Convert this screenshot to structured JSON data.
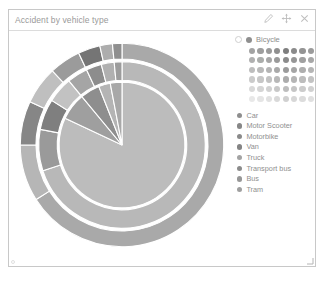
{
  "panel": {
    "title": "Accident by vehicle type",
    "tools": [
      {
        "name": "edit-icon",
        "label": "Edit"
      },
      {
        "name": "move-icon",
        "label": "Move"
      },
      {
        "name": "close-icon",
        "label": "Close"
      }
    ]
  },
  "selected": {
    "label": "Bicycle",
    "dot_color": "#8f8f8f",
    "ring_color": "#ffffff"
  },
  "palette": {
    "columns": 8,
    "rows": 6,
    "colors": [
      "#a3a3a3",
      "#9e9e9e",
      "#9a9a9a",
      "#8f8f8f",
      "#7e7e7e",
      "#8a8a8a",
      "#949494",
      "#9b9b9b",
      "#b0b0b0",
      "#abadab",
      "#a6a6a6",
      "#9a9a9a",
      "#8b8b8b",
      "#969696",
      "#a0a0a0",
      "#a7a7a7",
      "#bdbdbd",
      "#b9b9b9",
      "#b4b4b4",
      "#a9a9a9",
      "#9b9b9b",
      "#a5a5a5",
      "#aeaeae",
      "#b5b5b5",
      "#cbcbcb",
      "#c7c7c7",
      "#c2c2c2",
      "#b8b8b8",
      "#acacac",
      "#b5b5b5",
      "#bdbdbd",
      "#c3c3c3",
      "#d9d9d9",
      "#d5d5d5",
      "#d1d1d1",
      "#c8c8c8",
      "#bdbdbd",
      "#c5c5c5",
      "#cccccc",
      "#d1d1d1",
      "#e8e8e8",
      "#e5e5e5",
      "#e1e1e1",
      "#d9d9d9",
      "#d0d0d0",
      "#d7d7d7",
      "#dcdcdc",
      "#e0e0e0"
    ]
  },
  "legend": {
    "items": [
      {
        "label": "Car",
        "color": "#8e8e8e"
      },
      {
        "label": "Motor Scooter",
        "color": "#878787"
      },
      {
        "label": "Motorbike",
        "color": "#8a8a8a"
      },
      {
        "label": "Van",
        "color": "#848484"
      },
      {
        "label": "Truck",
        "color": "#a3a3a3"
      },
      {
        "label": "Transport bus",
        "color": "#8b8b8b"
      },
      {
        "label": "Bus",
        "color": "#979797"
      },
      {
        "label": "Tram",
        "color": "#9f9f9f"
      }
    ]
  },
  "chart_data": {
    "type": "pie",
    "variant": "sunburst",
    "title": "Accident by vehicle type",
    "legend_position": "right",
    "grid": false,
    "rings": [
      {
        "name": "inner",
        "inner_radius": 0,
        "outer_radius": 68,
        "segments": [
          {
            "label": "Car",
            "value": 82.0,
            "color": "#bcbcbc"
          },
          {
            "label": "Motor Scooter",
            "value": 7.0,
            "color": "#9f9f9f"
          },
          {
            "label": "Motorbike",
            "value": 5.0,
            "color": "#8e8e8e"
          },
          {
            "label": "Van",
            "value": 3.0,
            "color": "#b4b4b4"
          },
          {
            "label": "Truck",
            "value": 3.0,
            "color": "#a8a8a8"
          }
        ]
      },
      {
        "name": "middle",
        "inner_radius": 70,
        "outer_radius": 90,
        "segments": [
          {
            "label": "Car",
            "value": 70.0,
            "color": "#b8b8b8"
          },
          {
            "label": "Motor Scooter",
            "value": 8.0,
            "color": "#9a9a9a"
          },
          {
            "label": "Motorbike",
            "value": 6.0,
            "color": "#7f7f7f"
          },
          {
            "label": "Van",
            "value": 5.0,
            "color": "#c2c2c2"
          },
          {
            "label": "Truck",
            "value": 4.0,
            "color": "#a5a5a5"
          },
          {
            "label": "Transport bus",
            "value": 3.0,
            "color": "#8d8d8d"
          },
          {
            "label": "Bus",
            "value": 2.5,
            "color": "#b0b0b0"
          },
          {
            "label": "Tram",
            "value": 1.5,
            "color": "#9c9c9c"
          }
        ]
      },
      {
        "name": "outer",
        "inner_radius": 93,
        "outer_radius": 110,
        "segments": [
          {
            "label": "Car",
            "value": 66.0,
            "color": "#a9a9a9"
          },
          {
            "label": "Motor Scooter",
            "value": 9.0,
            "color": "#b6b6b6"
          },
          {
            "label": "Motorbike",
            "value": 7.0,
            "color": "#868686"
          },
          {
            "label": "Van",
            "value": 6.0,
            "color": "#bfbfbf"
          },
          {
            "label": "Truck",
            "value": 5.0,
            "color": "#9b9b9b"
          },
          {
            "label": "Transport bus",
            "value": 3.5,
            "color": "#757575"
          },
          {
            "label": "Bus",
            "value": 2.0,
            "color": "#adadad"
          },
          {
            "label": "Tram",
            "value": 1.5,
            "color": "#8f8f8f"
          }
        ]
      }
    ]
  }
}
